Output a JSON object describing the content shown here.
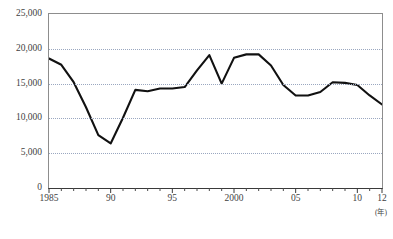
{
  "chart_data": {
    "type": "line",
    "title": "",
    "xlabel": "(年)",
    "ylabel": "",
    "ylim": [
      0,
      25000
    ],
    "xlim": [
      1985,
      2012
    ],
    "grid": true,
    "legend": "none",
    "y_ticks": [
      0,
      5000,
      10000,
      15000,
      20000,
      25000
    ],
    "y_tick_labels": [
      "0",
      "5,000",
      "10,000",
      "15,000",
      "20,000",
      "25,000"
    ],
    "x_tick_labels": [
      {
        "value": 1985,
        "label": "1985"
      },
      {
        "value": 1990,
        "label": "90"
      },
      {
        "value": 1995,
        "label": "95"
      },
      {
        "value": 2000,
        "label": "2000"
      },
      {
        "value": 2005,
        "label": "05"
      },
      {
        "value": 2010,
        "label": "10"
      },
      {
        "value": 2012,
        "label": "12"
      }
    ],
    "x": [
      1985,
      1986,
      1987,
      1988,
      1989,
      1990,
      1991,
      1992,
      1993,
      1994,
      1995,
      1996,
      1997,
      1998,
      1999,
      2000,
      2001,
      2002,
      2003,
      2004,
      2005,
      2006,
      2007,
      2008,
      2009,
      2010,
      2011,
      2012
    ],
    "categories": [
      "1985",
      "1986",
      "1987",
      "1988",
      "1989",
      "1990",
      "1991",
      "1992",
      "1993",
      "1994",
      "1995",
      "1996",
      "1997",
      "1998",
      "1999",
      "2000",
      "2001",
      "2002",
      "2003",
      "2004",
      "2005",
      "2006",
      "2007",
      "2008",
      "2009",
      "2010",
      "2011",
      "2012"
    ],
    "values": [
      18600,
      17700,
      15200,
      11600,
      7600,
      6400,
      10100,
      14100,
      13900,
      14300,
      14300,
      14500,
      16900,
      19100,
      15000,
      18700,
      19200,
      19200,
      17600,
      14800,
      13300,
      13300,
      13800,
      15200,
      15100,
      14800,
      13300,
      12000
    ],
    "series": [
      {
        "name": "series-1",
        "values": [
          18600,
          17700,
          15200,
          11600,
          7600,
          6400,
          10100,
          14100,
          13900,
          14300,
          14300,
          14500,
          16900,
          19100,
          15000,
          18700,
          19200,
          19200,
          17600,
          14800,
          13300,
          13300,
          13800,
          15200,
          15100,
          14800,
          13300,
          12000
        ]
      }
    ]
  },
  "axis": {
    "x_unit_label": "(年)"
  }
}
